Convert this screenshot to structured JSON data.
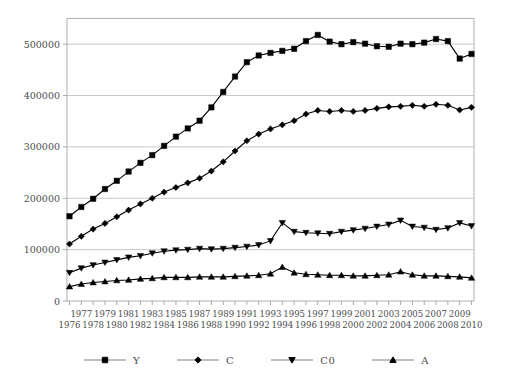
{
  "chart_data": {
    "type": "line",
    "x": [
      1976,
      1977,
      1978,
      1979,
      1980,
      1981,
      1982,
      1983,
      1984,
      1985,
      1986,
      1987,
      1988,
      1989,
      1990,
      1991,
      1992,
      1993,
      1994,
      1995,
      1996,
      1997,
      1998,
      1999,
      2000,
      2001,
      2002,
      2003,
      2004,
      2005,
      2006,
      2007,
      2008,
      2009,
      2010
    ],
    "series": [
      {
        "name": "Y",
        "marker": "square",
        "values": [
          165000,
          183000,
          199000,
          218000,
          234000,
          252000,
          269000,
          284000,
          302000,
          320000,
          336000,
          351000,
          377000,
          407000,
          437000,
          465000,
          478000,
          483000,
          487000,
          491000,
          506000,
          518000,
          505000,
          500000,
          504000,
          501000,
          496000,
          495000,
          501000,
          500000,
          503000,
          510000,
          506000,
          472000,
          481000
        ]
      },
      {
        "name": "C",
        "marker": "diamond",
        "values": [
          111000,
          126000,
          140000,
          151000,
          164000,
          177000,
          189000,
          200000,
          212000,
          221000,
          230000,
          239000,
          253000,
          271000,
          292000,
          312000,
          325000,
          335000,
          343000,
          351000,
          364000,
          371000,
          369000,
          371000,
          369000,
          371000,
          375000,
          378000,
          379000,
          381000,
          379000,
          383000,
          381000,
          372000,
          377000
        ]
      },
      {
        "name": "C0",
        "marker": "triangle-down",
        "values": [
          55000,
          64000,
          70000,
          75000,
          80000,
          85000,
          88000,
          93000,
          97000,
          99000,
          100000,
          102000,
          101000,
          102000,
          104000,
          106000,
          109000,
          117000,
          152000,
          135000,
          133000,
          132000,
          131000,
          135000,
          138000,
          141000,
          145000,
          149000,
          157000,
          145000,
          143000,
          139000,
          142000,
          152000,
          146000
        ]
      },
      {
        "name": "A",
        "marker": "triangle-up",
        "values": [
          28000,
          33000,
          36000,
          38000,
          40000,
          41000,
          43000,
          44000,
          46000,
          46000,
          46000,
          47000,
          47000,
          47000,
          48000,
          49000,
          50000,
          53000,
          66000,
          55000,
          52000,
          51000,
          50000,
          50000,
          49000,
          49000,
          50000,
          51000,
          57000,
          51000,
          49000,
          49000,
          48000,
          47000,
          45000
        ]
      }
    ],
    "ylim": [
      0,
      550000
    ],
    "y_ticks": [
      0,
      100000,
      200000,
      300000,
      400000,
      500000
    ],
    "y_tick_labels": [
      "0",
      "100000",
      "200000",
      "300000",
      "400000",
      "500000"
    ],
    "x_tick_labels_row_top": [
      "1977",
      "1979",
      "1981",
      "1983",
      "1985",
      "1987",
      "1989",
      "1991",
      "1993",
      "1995",
      "1997",
      "1999",
      "2001",
      "2003",
      "2005",
      "2007",
      "2009"
    ],
    "x_tick_labels_row_bottom": [
      "1976",
      "1978",
      "1980",
      "1982",
      "1984",
      "1986",
      "1988",
      "1990",
      "1992",
      "1994",
      "1996",
      "1998",
      "2000",
      "2002",
      "2004",
      "2006",
      "2008",
      "2010"
    ],
    "grid": "horizontal-only",
    "legend_position": "bottom-center",
    "colors": {
      "background": "#ffffff",
      "series_line": "#000000",
      "marker": "#000000",
      "frame": "#b0b0b0",
      "grid": "#c9c9c9",
      "tick": "#a8a8a8",
      "text": "#4d4d4d",
      "legend_line": "#808080"
    }
  }
}
